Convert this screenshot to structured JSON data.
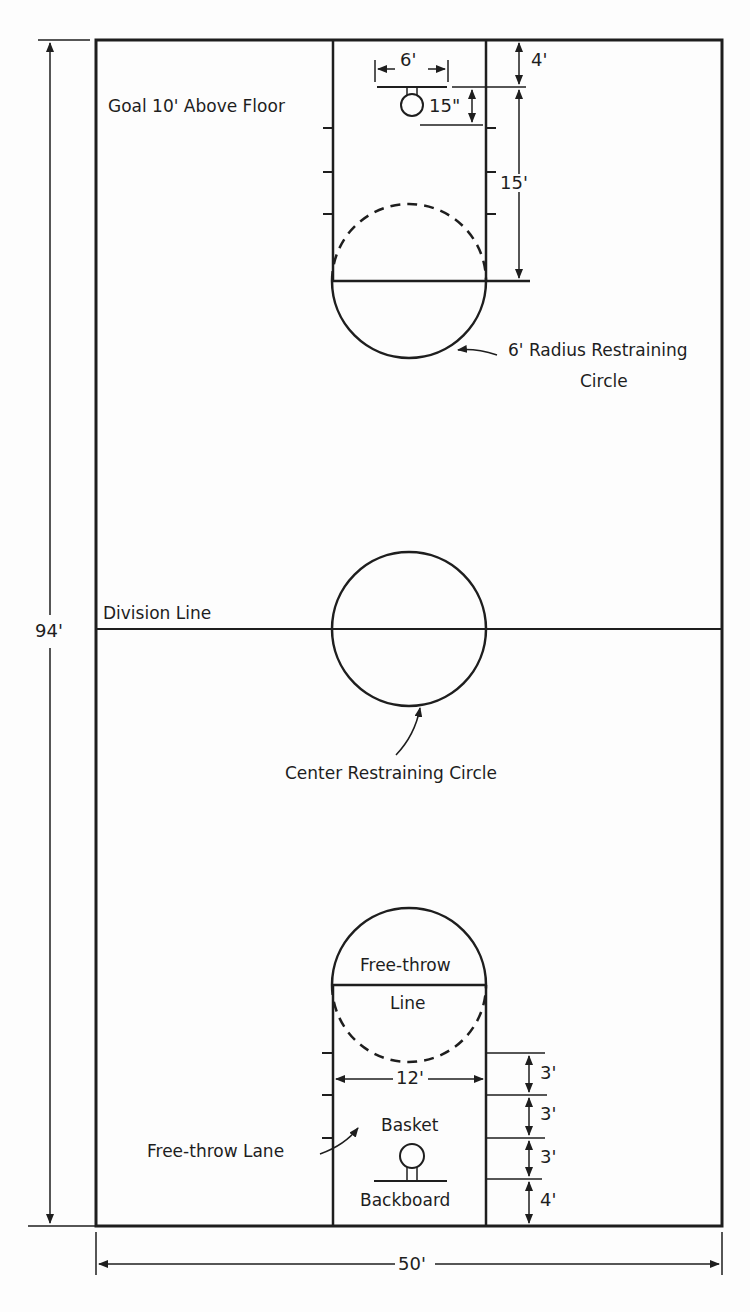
{
  "diagram": {
    "type": "basketball-court-layout",
    "colors": {
      "line": "#1e1e1e",
      "background": "#fdfdfd"
    },
    "dimensions": {
      "court_length": "94'",
      "court_width": "50'",
      "basket_to_endline": "4'",
      "backboard_width": "6'",
      "basket_offset": "15\"",
      "freethrow_distance": "15'",
      "lane_width": "12'",
      "lane_spaces": [
        "3'",
        "3'",
        "3'",
        "4'"
      ]
    },
    "labels": {
      "goal": "Goal 10' Above Floor",
      "radius_circle_line1": "6' Radius Restraining",
      "radius_circle_line2": "Circle",
      "division_line": "Division Line",
      "center_circle": "Center Restraining Circle",
      "freethrow_top": "Free-throw",
      "freethrow_bottom": "Line",
      "freethrow_lane": "Free-throw Lane",
      "basket": "Basket",
      "backboard": "Backboard"
    }
  }
}
